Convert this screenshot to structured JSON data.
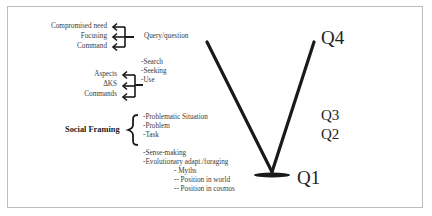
{
  "diagram": {
    "group1": {
      "labels": [
        "Compromised need",
        "Focusing",
        "Command"
      ],
      "target": "Query/question"
    },
    "group2": {
      "labels": [
        "Aspects",
        "ΔKS",
        "Commands"
      ],
      "items": [
        "-Search",
        "-Seeking",
        "-Use"
      ]
    },
    "social_framing": {
      "label": "Social Framing",
      "items": [
        "-Problematic Situation",
        "-Problem",
        "-Task"
      ]
    },
    "sense_making": {
      "items": [
        "-Sense-making",
        "-Evolutionary adapt./foraging"
      ],
      "sub_items": [
        "- Myths",
        "-- Position in world",
        "-- Position in cosmos"
      ]
    },
    "levels": {
      "q4": "Q4",
      "q3": "Q3",
      "q2": "Q2",
      "q1": "Q1"
    }
  }
}
